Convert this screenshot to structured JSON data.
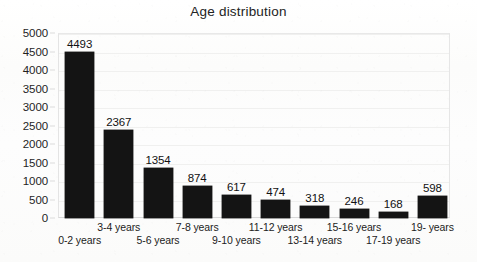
{
  "chart_data": {
    "type": "bar",
    "title": "Age distribution",
    "xlabel": "",
    "ylabel": "",
    "categories": [
      "0-2 years",
      "3-4 years",
      "5-6 years",
      "7-8 years",
      "9-10 years",
      "11-12 years",
      "13-14 years",
      "15-16 years",
      "17-19 years",
      "19- years"
    ],
    "values": [
      4493,
      2367,
      1354,
      874,
      617,
      474,
      318,
      246,
      168,
      598
    ],
    "ylim": [
      0,
      5000
    ],
    "ytick_labels": [
      "5000",
      "4500",
      "4000",
      "3500",
      "3000",
      "2500",
      "2000",
      "1500",
      "1000",
      "500",
      "0"
    ],
    "ytick_values": [
      5000,
      4500,
      4000,
      3500,
      3000,
      2500,
      2000,
      1500,
      1000,
      500,
      0
    ],
    "ytick_step": 500,
    "grid": true,
    "legend": false,
    "data_labels": true,
    "bar_color": "#141414",
    "background_color": "#fdfdfc",
    "text_color": "#1f1f1f",
    "xtick_label_layout": "staggered-two-rows"
  }
}
